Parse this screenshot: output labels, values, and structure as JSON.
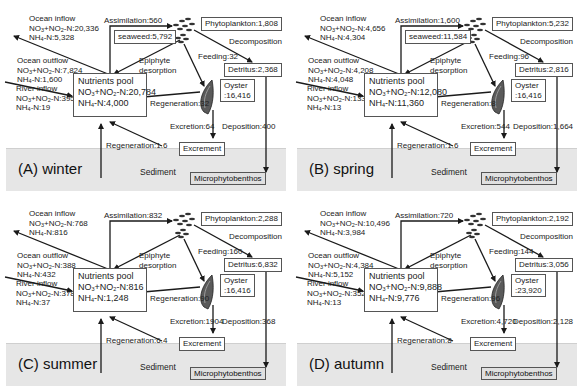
{
  "labels": {
    "ocean_inflow": "Ocean inflow",
    "ocean_outflow": "Ocean outflow",
    "river_inflow": "River inflow",
    "nutrients_pool": "Nutrients pool",
    "no3_prefix": "NO",
    "nh4_prefix": "NH",
    "epiphyte": "Epiphyte",
    "desorption": "desorption",
    "decomposition": "Decomposition",
    "excrement": "Excrement",
    "sediment": "Sediment",
    "microphytobenthos": "Microphytobenthos",
    "oyster": "Oyster"
  },
  "panels": [
    {
      "season": "(A) winter",
      "ocean_inflow": {
        "no3": "NO3+NO2-N:20,336",
        "nh4": "NH4-N:5,328"
      },
      "ocean_outflow": {
        "no3": "NO3+NO2-N:7,824",
        "nh4": "NH4-N:1,600"
      },
      "river_inflow": {
        "no3": "NO3+NO2-N:395",
        "nh4": "NH4-N:19"
      },
      "pool": {
        "no3": "NO3+NO2-N:20,784",
        "nh4": "NH4-N:4,000"
      },
      "assimilation": "Assimilation:560",
      "seaweed": "seaweed:5,792",
      "phytoplankton": "Phytoplankton:1,808",
      "feeding": "Feeding:32",
      "detritus": "Detritus:2,368",
      "oyster_value": ":16,416",
      "regeneration_oyster": "Regeneration:32",
      "excretion": "Excretion:64",
      "deposition": "Deposition:400",
      "regeneration_excrement": "Regeneration:1.6",
      "no3_num": "+NO",
      "no3_val": "-N:20,336"
    },
    {
      "season": "(B) spring",
      "ocean_inflow": {
        "no3": "NO3+NO2-N:4,656",
        "nh4": "NH4-N:4,304"
      },
      "ocean_outflow": {
        "no3": "NO3+NO2-N:4,208",
        "nh4": "NH4-N:4,048"
      },
      "river_inflow": {
        "no3": "NO3+NO2-N:133",
        "nh4": "NH4-N:13"
      },
      "pool": {
        "no3": "NO3+NO2-N:12,080",
        "nh4": "NH4-N:11,360"
      },
      "assimilation": "Assimilation:1,600",
      "seaweed": "seaweed:11,584",
      "phytoplankton": "Phytoplankton:5,232",
      "feeding": "Feeding:96",
      "detritus": "Detritus:2,816",
      "oyster_value": ":16,416",
      "regeneration_oyster": "Regeneration:8",
      "excretion": "Excretion:544",
      "deposition": "Deposition:1,664",
      "regeneration_excrement": "Regeneration:1.6"
    },
    {
      "season": "(C) summer",
      "ocean_inflow": {
        "no3": "NO3+NO2-N:768",
        "nh4": "NH4-N:816"
      },
      "ocean_outflow": {
        "no3": "NO3+NO2-N:388",
        "nh4": "NH4-N:432"
      },
      "river_inflow": {
        "no3": "NO3+NO2-N:378",
        "nh4": "NH4-N:37"
      },
      "pool": {
        "no3": "NO3+NO2-N:816",
        "nh4": "NH4-N:1,248"
      },
      "assimilation": "Assimilation:832",
      "seaweed": "",
      "phytoplankton": "Phytoplankton:2,288",
      "feeding": "Feeding:160",
      "detritus": "Detritus:6,832",
      "oyster_value": ":16,416",
      "regeneration_oyster": "Regeneration:90",
      "excretion": "Excretion:1904",
      "deposition": "Deposition:368",
      "regeneration_excrement": "Regeneration:6.4"
    },
    {
      "season": "(D) autumn",
      "ocean_inflow": {
        "no3": "NO3+NO2-N:10,496",
        "nh4": "NH4-N:3,984"
      },
      "ocean_outflow": {
        "no3": "NO3+NO2-N:4,384",
        "nh4": "NH4-N:5,152"
      },
      "river_inflow": {
        "no3": "NO3+NO2-N:352",
        "nh4": "NH4-N:13"
      },
      "pool": {
        "no3": "NO3+NO2-N:9,888",
        "nh4": "NH4-N:9,776"
      },
      "assimilation": "Assimilation:720",
      "seaweed": "",
      "phytoplankton": "Phytoplankton:2,192",
      "feeding": "Feeding:144",
      "detritus": "Detritus:3,056",
      "oyster_value": ":23,920",
      "regeneration_oyster": "Regeneration:96",
      "excretion": "Excretion:4,720",
      "deposition": "Deposition:2,128",
      "regeneration_excrement": "Regeneration:8"
    }
  ],
  "colors": {
    "sediment": "#e6e6e6",
    "line": "#1a1a1a",
    "oyster": "#555555"
  }
}
